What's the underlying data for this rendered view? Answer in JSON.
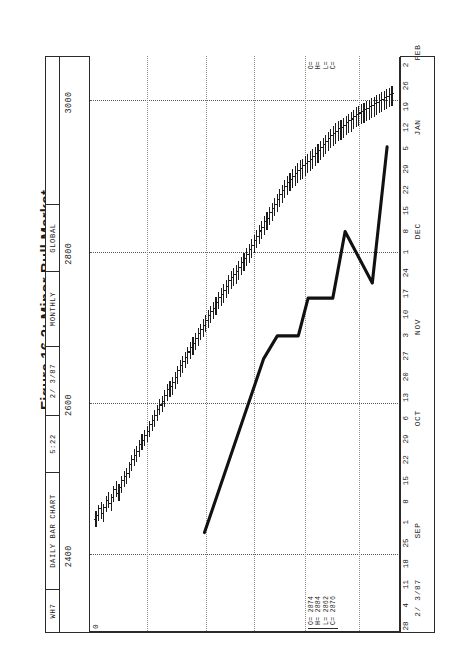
{
  "figure": {
    "caption": "Figure 16.2: Minor Bull Market"
  },
  "header": {
    "symbol": "WH7",
    "chart_type": "DAILY BAR CHART",
    "time": "5:22",
    "date": "2/ 3/87",
    "period": "MONTHLY",
    "source": "GLOBAL"
  },
  "quote_left": {
    "open_label": "O=",
    "high_label": "H=",
    "low_label": "L=",
    "close_label": "C=",
    "open": "2874",
    "high": "2884",
    "low": "2862",
    "close": "2876",
    "text": "O= 2874\nH= 2884\nL= 2862\nC= 2876"
  },
  "quote_right": {
    "text": "O=\nH=\nL=\nC="
  },
  "axis_note_left": "2/ 3/87",
  "chart_data": {
    "type": "ohlc",
    "title": "Figure 16.2: Minor Bull Market",
    "subtitle": "WH7 DAILY BAR CHART",
    "xlabel": "",
    "ylabel": "",
    "orientation": "rotated-90-ccw",
    "grid": true,
    "legend": "none",
    "ylim": [
      2300,
      3060
    ],
    "yticks": [
      3000,
      2800,
      2600,
      2400
    ],
    "ytick_labels": [
      "3000",
      "2800",
      "2600",
      "2400"
    ],
    "xlim": [
      "1986-07-28",
      "1987-02-02"
    ],
    "xtick_labels": [
      "28",
      "4",
      "11",
      "18",
      "25",
      "1",
      "8",
      "15",
      "22",
      "29",
      "6",
      "13",
      "20",
      "27",
      "3",
      "10",
      "17",
      "24",
      "1",
      "8",
      "15",
      "22",
      "29",
      "5",
      "12",
      "19",
      "26",
      "2"
    ],
    "month_labels": [
      "SEP",
      "OCT",
      "NOV",
      "DEC",
      "JAN",
      "FEB"
    ],
    "month_positions": [
      4.6,
      10.0,
      14.4,
      19.0,
      24.0,
      27.6
    ],
    "series": [
      {
        "name": "WH7 daily OHLC",
        "bars": [
          {
            "o": 2447,
            "h": 2458,
            "l": 2437,
            "c": 2452
          },
          {
            "o": 2452,
            "h": 2466,
            "l": 2445,
            "c": 2461
          },
          {
            "o": 2461,
            "h": 2470,
            "l": 2448,
            "c": 2455
          },
          {
            "o": 2455,
            "h": 2468,
            "l": 2444,
            "c": 2462
          },
          {
            "o": 2462,
            "h": 2479,
            "l": 2457,
            "c": 2472
          },
          {
            "o": 2472,
            "h": 2484,
            "l": 2462,
            "c": 2468
          },
          {
            "o": 2468,
            "h": 2481,
            "l": 2459,
            "c": 2476
          },
          {
            "o": 2476,
            "h": 2492,
            "l": 2470,
            "c": 2486
          },
          {
            "o": 2486,
            "h": 2498,
            "l": 2477,
            "c": 2481
          },
          {
            "o": 2481,
            "h": 2494,
            "l": 2472,
            "c": 2489
          },
          {
            "o": 2489,
            "h": 2505,
            "l": 2483,
            "c": 2498
          },
          {
            "o": 2498,
            "h": 2512,
            "l": 2490,
            "c": 2503
          },
          {
            "o": 2503,
            "h": 2516,
            "l": 2494,
            "c": 2508
          },
          {
            "o": 2508,
            "h": 2524,
            "l": 2502,
            "c": 2519
          },
          {
            "o": 2519,
            "h": 2533,
            "l": 2511,
            "c": 2526
          },
          {
            "o": 2526,
            "h": 2540,
            "l": 2518,
            "c": 2531
          },
          {
            "o": 2531,
            "h": 2545,
            "l": 2524,
            "c": 2537
          },
          {
            "o": 2537,
            "h": 2552,
            "l": 2530,
            "c": 2546
          },
          {
            "o": 2546,
            "h": 2560,
            "l": 2539,
            "c": 2551
          },
          {
            "o": 2551,
            "h": 2566,
            "l": 2544,
            "c": 2558
          },
          {
            "o": 2558,
            "h": 2571,
            "l": 2550,
            "c": 2563
          },
          {
            "o": 2563,
            "h": 2578,
            "l": 2556,
            "c": 2572
          },
          {
            "o": 2572,
            "h": 2586,
            "l": 2564,
            "c": 2578
          },
          {
            "o": 2578,
            "h": 2592,
            "l": 2570,
            "c": 2584
          },
          {
            "o": 2584,
            "h": 2599,
            "l": 2577,
            "c": 2592
          },
          {
            "o": 2592,
            "h": 2606,
            "l": 2585,
            "c": 2598
          },
          {
            "o": 2598,
            "h": 2611,
            "l": 2589,
            "c": 2603
          },
          {
            "o": 2603,
            "h": 2618,
            "l": 2596,
            "c": 2611
          },
          {
            "o": 2611,
            "h": 2626,
            "l": 2604,
            "c": 2618
          },
          {
            "o": 2618,
            "h": 2631,
            "l": 2609,
            "c": 2622
          },
          {
            "o": 2622,
            "h": 2636,
            "l": 2612,
            "c": 2628
          },
          {
            "o": 2628,
            "h": 2643,
            "l": 2620,
            "c": 2634
          },
          {
            "o": 2634,
            "h": 2650,
            "l": 2627,
            "c": 2644
          },
          {
            "o": 2644,
            "h": 2658,
            "l": 2636,
            "c": 2650
          },
          {
            "o": 2650,
            "h": 2664,
            "l": 2641,
            "c": 2655
          },
          {
            "o": 2655,
            "h": 2669,
            "l": 2647,
            "c": 2661
          },
          {
            "o": 2661,
            "h": 2676,
            "l": 2653,
            "c": 2668
          },
          {
            "o": 2668,
            "h": 2682,
            "l": 2660,
            "c": 2674
          },
          {
            "o": 2674,
            "h": 2688,
            "l": 2665,
            "c": 2679
          },
          {
            "o": 2679,
            "h": 2694,
            "l": 2671,
            "c": 2686
          },
          {
            "o": 2686,
            "h": 2700,
            "l": 2677,
            "c": 2692
          },
          {
            "o": 2692,
            "h": 2706,
            "l": 2684,
            "c": 2698
          },
          {
            "o": 2698,
            "h": 2712,
            "l": 2689,
            "c": 2703
          },
          {
            "o": 2703,
            "h": 2718,
            "l": 2695,
            "c": 2710
          },
          {
            "o": 2710,
            "h": 2724,
            "l": 2701,
            "c": 2716
          },
          {
            "o": 2716,
            "h": 2730,
            "l": 2707,
            "c": 2721
          },
          {
            "o": 2721,
            "h": 2735,
            "l": 2712,
            "c": 2726
          },
          {
            "o": 2726,
            "h": 2741,
            "l": 2718,
            "c": 2733
          },
          {
            "o": 2733,
            "h": 2748,
            "l": 2725,
            "c": 2740
          },
          {
            "o": 2740,
            "h": 2754,
            "l": 2730,
            "c": 2744
          },
          {
            "o": 2744,
            "h": 2758,
            "l": 2734,
            "c": 2749
          },
          {
            "o": 2749,
            "h": 2764,
            "l": 2740,
            "c": 2755
          },
          {
            "o": 2755,
            "h": 2770,
            "l": 2746,
            "c": 2762
          },
          {
            "o": 2762,
            "h": 2776,
            "l": 2752,
            "c": 2767
          },
          {
            "o": 2767,
            "h": 2780,
            "l": 2756,
            "c": 2770
          },
          {
            "o": 2770,
            "h": 2784,
            "l": 2759,
            "c": 2774
          },
          {
            "o": 2774,
            "h": 2789,
            "l": 2764,
            "c": 2780
          },
          {
            "o": 2780,
            "h": 2795,
            "l": 2770,
            "c": 2786
          },
          {
            "o": 2786,
            "h": 2800,
            "l": 2776,
            "c": 2792
          },
          {
            "o": 2792,
            "h": 2806,
            "l": 2782,
            "c": 2797
          },
          {
            "o": 2797,
            "h": 2812,
            "l": 2787,
            "c": 2803
          },
          {
            "o": 2803,
            "h": 2818,
            "l": 2793,
            "c": 2809
          },
          {
            "o": 2809,
            "h": 2824,
            "l": 2800,
            "c": 2816
          },
          {
            "o": 2816,
            "h": 2830,
            "l": 2806,
            "c": 2821
          },
          {
            "o": 2821,
            "h": 2836,
            "l": 2812,
            "c": 2828
          },
          {
            "o": 2828,
            "h": 2842,
            "l": 2818,
            "c": 2833
          },
          {
            "o": 2833,
            "h": 2848,
            "l": 2824,
            "c": 2840
          },
          {
            "o": 2840,
            "h": 2854,
            "l": 2830,
            "c": 2845
          },
          {
            "o": 2845,
            "h": 2860,
            "l": 2836,
            "c": 2852
          },
          {
            "o": 2852,
            "h": 2866,
            "l": 2842,
            "c": 2858
          },
          {
            "o": 2858,
            "h": 2872,
            "l": 2848,
            "c": 2863
          },
          {
            "o": 2863,
            "h": 2878,
            "l": 2854,
            "c": 2870
          },
          {
            "o": 2870,
            "h": 2884,
            "l": 2860,
            "c": 2876
          },
          {
            "o": 2876,
            "h": 2890,
            "l": 2866,
            "c": 2882
          },
          {
            "o": 2882,
            "h": 2896,
            "l": 2872,
            "c": 2887
          },
          {
            "o": 2887,
            "h": 2901,
            "l": 2876,
            "c": 2892
          },
          {
            "o": 2892,
            "h": 2906,
            "l": 2881,
            "c": 2896
          },
          {
            "o": 2896,
            "h": 2910,
            "l": 2885,
            "c": 2900
          },
          {
            "o": 2900,
            "h": 2914,
            "l": 2888,
            "c": 2904
          },
          {
            "o": 2904,
            "h": 2918,
            "l": 2892,
            "c": 2908
          },
          {
            "o": 2908,
            "h": 2922,
            "l": 2896,
            "c": 2911
          },
          {
            "o": 2911,
            "h": 2924,
            "l": 2898,
            "c": 2914
          },
          {
            "o": 2914,
            "h": 2928,
            "l": 2902,
            "c": 2917
          },
          {
            "o": 2917,
            "h": 2931,
            "l": 2905,
            "c": 2920
          },
          {
            "o": 2920,
            "h": 2934,
            "l": 2908,
            "c": 2923
          },
          {
            "o": 2923,
            "h": 2937,
            "l": 2911,
            "c": 2926
          },
          {
            "o": 2926,
            "h": 2940,
            "l": 2914,
            "c": 2930
          },
          {
            "o": 2930,
            "h": 2944,
            "l": 2918,
            "c": 2934
          },
          {
            "o": 2934,
            "h": 2948,
            "l": 2922,
            "c": 2938
          },
          {
            "o": 2938,
            "h": 2952,
            "l": 2926,
            "c": 2942
          },
          {
            "o": 2942,
            "h": 2956,
            "l": 2930,
            "c": 2946
          },
          {
            "o": 2946,
            "h": 2960,
            "l": 2934,
            "c": 2950
          },
          {
            "o": 2950,
            "h": 2964,
            "l": 2938,
            "c": 2954
          },
          {
            "o": 2954,
            "h": 2968,
            "l": 2941,
            "c": 2957
          },
          {
            "o": 2957,
            "h": 2971,
            "l": 2944,
            "c": 2960
          },
          {
            "o": 2960,
            "h": 2974,
            "l": 2947,
            "c": 2963
          },
          {
            "o": 2963,
            "h": 2976,
            "l": 2949,
            "c": 2965
          },
          {
            "o": 2965,
            "h": 2978,
            "l": 2952,
            "c": 2968
          },
          {
            "o": 2968,
            "h": 2981,
            "l": 2955,
            "c": 2971
          },
          {
            "o": 2971,
            "h": 2984,
            "l": 2958,
            "c": 2974
          },
          {
            "o": 2974,
            "h": 2986,
            "l": 2960,
            "c": 2976
          },
          {
            "o": 2976,
            "h": 2989,
            "l": 2963,
            "c": 2979
          },
          {
            "o": 2979,
            "h": 2992,
            "l": 2966,
            "c": 2982
          },
          {
            "o": 2982,
            "h": 2994,
            "l": 2968,
            "c": 2984
          },
          {
            "o": 2984,
            "h": 2996,
            "l": 2970,
            "c": 2986
          },
          {
            "o": 2986,
            "h": 2998,
            "l": 2972,
            "c": 2988
          },
          {
            "o": 2988,
            "h": 3000,
            "l": 2974,
            "c": 2990
          },
          {
            "o": 2990,
            "h": 3002,
            "l": 2976,
            "c": 2992
          },
          {
            "o": 2992,
            "h": 3004,
            "l": 2978,
            "c": 2994
          },
          {
            "o": 2994,
            "h": 3006,
            "l": 2980,
            "c": 2996
          },
          {
            "o": 2996,
            "h": 3008,
            "l": 2982,
            "c": 2998
          },
          {
            "o": 2998,
            "h": 3010,
            "l": 2984,
            "c": 3000
          },
          {
            "o": 3000,
            "h": 3012,
            "l": 2986,
            "c": 3002
          },
          {
            "o": 3002,
            "h": 3014,
            "l": 2988,
            "c": 3004
          },
          {
            "o": 3004,
            "h": 3016,
            "l": 2990,
            "c": 3006
          },
          {
            "o": 3006,
            "h": 3018,
            "l": 2992,
            "c": 3008
          },
          {
            "o": 3008,
            "h": 3020,
            "l": 2994,
            "c": 3010
          }
        ]
      }
    ],
    "trendline": {
      "name": "uptrend support line",
      "points": [
        {
          "x": 44.0,
          "y": 2430
        },
        {
          "x": 68.0,
          "y": 2660
        },
        {
          "x": 73.5,
          "y": 2690
        },
        {
          "x": 82.0,
          "y": 2690
        },
        {
          "x": 86.0,
          "y": 2740
        },
        {
          "x": 96.0,
          "y": 2740
        },
        {
          "x": 101.0,
          "y": 2828
        },
        {
          "x": 112.0,
          "y": 2760
        },
        {
          "x": 118.0,
          "y": 2940
        }
      ]
    }
  }
}
